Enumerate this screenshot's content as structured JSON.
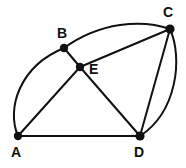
{
  "figure": {
    "width": 186,
    "height": 168,
    "background_color": "#ffffff",
    "stroke_color": "#111111",
    "label_color": "#111111",
    "vertices": [
      {
        "id": "A",
        "label": "A",
        "x": 18,
        "y": 136,
        "label_x": 11,
        "label_y": 145,
        "dot_radius": 4.2
      },
      {
        "id": "B",
        "label": "B",
        "x": 64,
        "y": 48,
        "label_x": 57,
        "label_y": 26,
        "dot_radius": 4.2
      },
      {
        "id": "C",
        "label": "C",
        "x": 170,
        "y": 29,
        "label_x": 163,
        "label_y": 5,
        "dot_radius": 4.6
      },
      {
        "id": "D",
        "label": "D",
        "x": 140,
        "y": 136,
        "label_x": 134,
        "label_y": 145,
        "dot_radius": 4.6
      },
      {
        "id": "E",
        "label": "E",
        "x": 80,
        "y": 67,
        "label_x": 89,
        "label_y": 62,
        "dot_radius": 4.2
      }
    ],
    "segments": [
      {
        "id": "AD",
        "from": "A",
        "to": "D",
        "kind": "straight",
        "path": "M 18 136 L 140 136"
      },
      {
        "id": "AE",
        "from": "A",
        "to": "E",
        "kind": "straight",
        "path": "M 18 136 L 80 67"
      },
      {
        "id": "BE",
        "from": "B",
        "to": "E",
        "kind": "straight",
        "path": "M 64 48 L 80 67"
      },
      {
        "id": "EC",
        "from": "E",
        "to": "C",
        "kind": "straight",
        "path": "M 80 67 L 170 29"
      },
      {
        "id": "ED",
        "from": "E",
        "to": "D",
        "kind": "straight",
        "path": "M 80 67 L 140 136"
      },
      {
        "id": "CD",
        "from": "C",
        "to": "D",
        "kind": "straight",
        "path": "M 170 29 L 140 136"
      }
    ],
    "arcs": [
      {
        "id": "arc-AB",
        "from": "A",
        "to": "B",
        "kind": "arc",
        "bulge": "left",
        "path": "M 18 136 C 6 108 20 66 64 48"
      },
      {
        "id": "arc-BC",
        "from": "B",
        "to": "C",
        "kind": "arc",
        "bulge": "up",
        "path": "M 64 48 C 100 22 142 19 170 29"
      },
      {
        "id": "arc-CD",
        "from": "C",
        "to": "D",
        "kind": "arc",
        "bulge": "right",
        "path": "M 170 29 C 183 58 177 112 140 136"
      }
    ]
  }
}
